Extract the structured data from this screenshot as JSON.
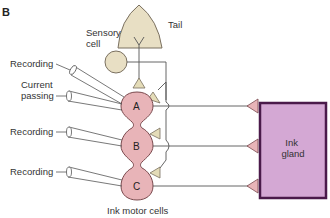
{
  "panel_label": "B",
  "labels": {
    "tail": "Tail",
    "sensory_cell": [
      "Sensory",
      "cell"
    ],
    "recording_top": "Recording",
    "current_passing": [
      "Current",
      "passing"
    ],
    "recording_mid": "Recording",
    "recording_bottom": "Recording",
    "ink_motor_cells": "Ink motor cells",
    "ink_gland": [
      "Ink",
      "gland"
    ]
  },
  "cells": [
    {
      "id": "A",
      "label": "A"
    },
    {
      "id": "B",
      "label": "B"
    },
    {
      "id": "C",
      "label": "C"
    }
  ],
  "colors": {
    "motor_cell_fill": "#e8b4b8",
    "motor_cell_stroke": "#7a4a4e",
    "sensory_fill": "#e8dfc4",
    "sensory_stroke": "#7a7060",
    "synapse_fill": "#e8b4b8",
    "sensory_synapse_fill": "#e4dcb8",
    "gland_fill": "#d4a8d4",
    "gland_stroke": "#4a1a4a",
    "line": "#555555"
  }
}
